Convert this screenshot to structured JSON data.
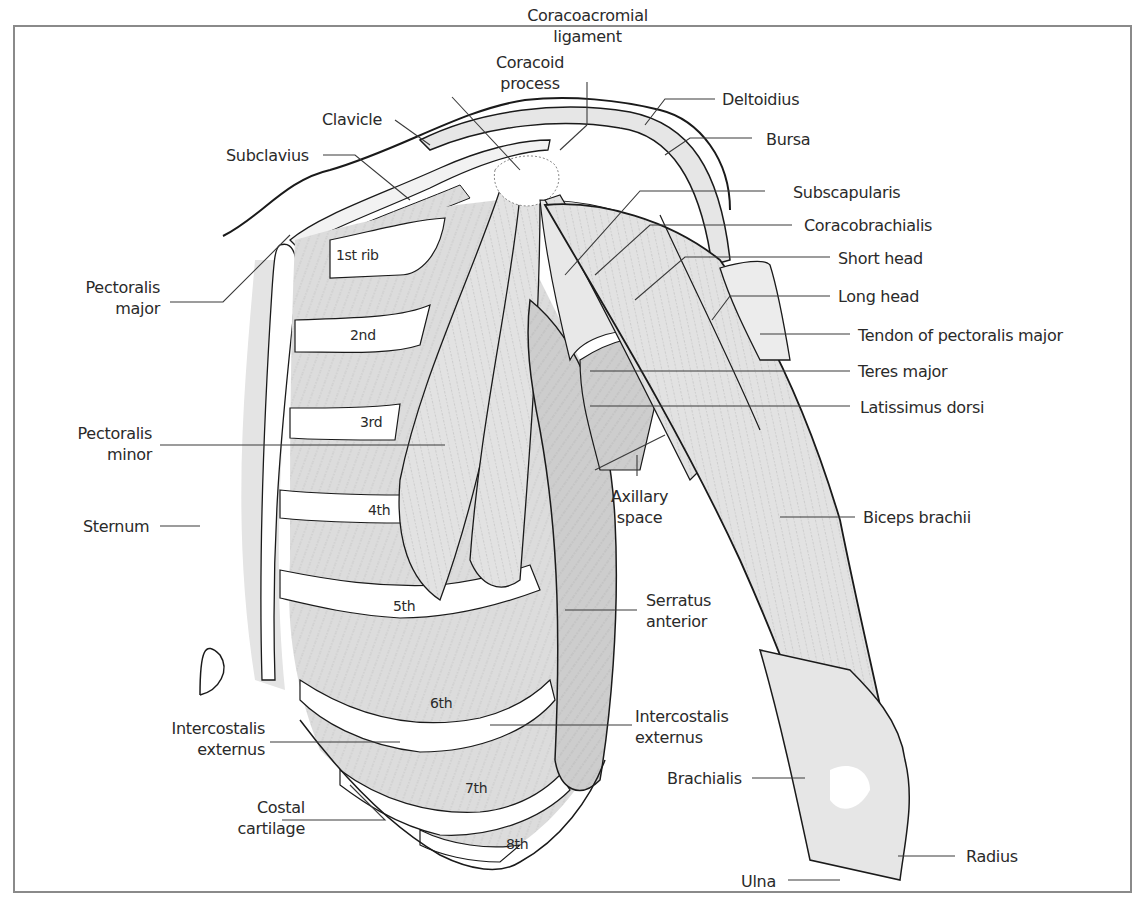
{
  "figure": {
    "colors": {
      "outline": "#1a1a1a",
      "muscle_fill": "#dcdcdc",
      "muscle_dark": "#c4c4c4",
      "muscle_light": "#ececec",
      "bone_fill": "#ffffff",
      "leader": "#3a3a3a",
      "frame": "#8a8a8a",
      "text": "#2a2a2a"
    }
  },
  "labels": {
    "coracoid_process": "Coracoid\nprocess",
    "coracoacromial_ligament": "Coracoacromial\nligament",
    "clavicle": "Clavicle",
    "subclavius": "Subclavius",
    "deltoidius": "Deltoidius",
    "bursa": "Bursa",
    "subscapularis": "Subscapularis",
    "coracobrachialis": "Coracobrachialis",
    "short_head": "Short head",
    "long_head": "Long head",
    "tendon_pectoralis_major": "Tendon of pectoralis major",
    "teres_major": "Teres major",
    "latissimus_dorsi": "Latissimus dorsi",
    "pectoralis_major": "Pectoralis\nmajor",
    "pectoralis_minor": "Pectoralis\nminor",
    "sternum": "Sternum",
    "axillary_space": "Axillary\nspace",
    "biceps_brachii": "Biceps brachii",
    "serratus_anterior": "Serratus\nanterior",
    "intercostalis_externus_left": "Intercostalis\nexternus",
    "intercostalis_externus_right": "Intercostalis\nexternus",
    "costal_cartilage": "Costal\ncartilage",
    "brachialis": "Brachialis",
    "radius": "Radius",
    "ulna": "Ulna"
  },
  "ribs": [
    "1st rib",
    "2nd",
    "3rd",
    "4th",
    "5th",
    "6th",
    "7th",
    "8th"
  ]
}
